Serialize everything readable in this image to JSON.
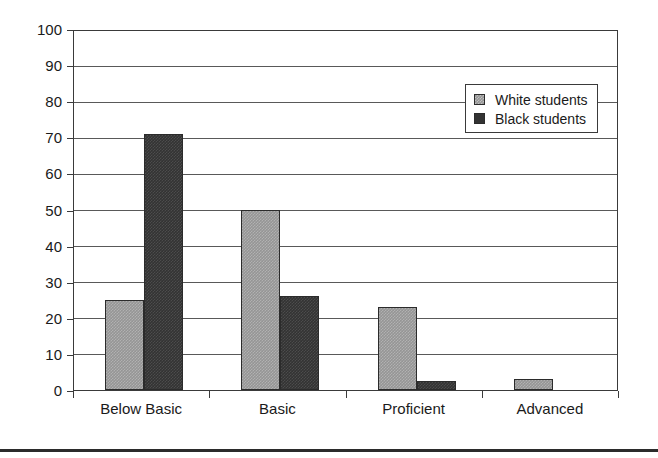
{
  "chart_data": {
    "type": "bar",
    "title": "",
    "subtitle": "",
    "xlabel": "",
    "ylabel": "",
    "categories": [
      "Below Basic",
      "Basic",
      "Proficient",
      "Advanced"
    ],
    "series": [
      {
        "name": "White students",
        "color": "#959595",
        "values": [
          25,
          50,
          23,
          3
        ]
      },
      {
        "name": "Black students",
        "color": "#333333",
        "values": [
          71,
          26,
          2.5,
          0
        ]
      }
    ],
    "ylim": [
      0,
      100
    ],
    "ytick_labels": [
      "100",
      "90",
      "80",
      "70",
      "60",
      "50",
      "40",
      "30",
      "20",
      "10",
      "0"
    ],
    "ytick_values": [
      100,
      90,
      80,
      70,
      60,
      50,
      40,
      30,
      20,
      10,
      0
    ],
    "ystep": 10,
    "grid": true,
    "grid_axis": "y",
    "legend_position": "upper-right-inside",
    "legend_entries": [
      "White students",
      "Black students"
    ],
    "frame": true,
    "background": "#ffffff"
  }
}
